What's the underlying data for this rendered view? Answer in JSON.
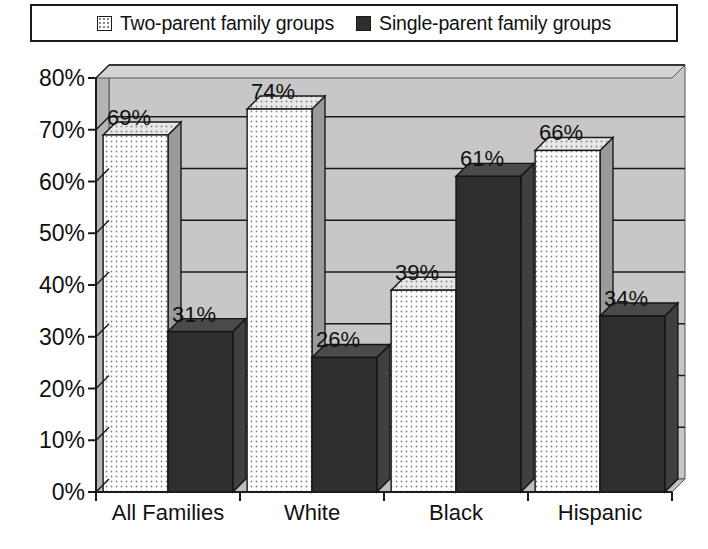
{
  "legend": {
    "items": [
      {
        "label": "Two-parent family groups",
        "swatch": "light-dotted-square",
        "color": "#ffffff"
      },
      {
        "label": "Single-parent family groups",
        "swatch": "dark-solid-square",
        "color": "#2e2e2e"
      }
    ]
  },
  "chart_data": {
    "type": "bar",
    "title": "",
    "xlabel": "",
    "ylabel": "",
    "categories": [
      "All Families",
      "White",
      "Black",
      "Hispanic"
    ],
    "series": [
      {
        "name": "Two-parent family groups",
        "values": [
          69,
          74,
          39,
          66
        ],
        "labels": [
          "69%",
          "74%",
          "39%",
          "66%"
        ],
        "color": "#ffffff"
      },
      {
        "name": "Single-parent family groups",
        "values": [
          31,
          26,
          61,
          34
        ],
        "labels": [
          "31%",
          "26%",
          "61%",
          "34%"
        ],
        "color": "#2e2e2e"
      }
    ],
    "ylim": [
      0,
      80
    ],
    "yticks": [
      0,
      10,
      20,
      30,
      40,
      50,
      60,
      70,
      80
    ],
    "ytick_labels": [
      "0%",
      "10%",
      "20%",
      "30%",
      "40%",
      "50%",
      "60%",
      "70%",
      "80%"
    ],
    "grid": true,
    "legend_position": "top",
    "style": "3d-grouped-bars",
    "plot_background": "#c8c8c8",
    "gridline_color": "#1a1a1a"
  }
}
